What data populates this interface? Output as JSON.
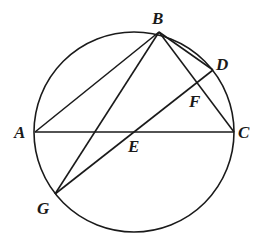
{
  "diagram": {
    "type": "circle-geometry",
    "circle": {
      "cx": 134,
      "cy": 132,
      "r": 100
    },
    "points": {
      "A": {
        "x": 35,
        "y": 132,
        "label": "A",
        "lx": 14,
        "ly": 138
      },
      "B": {
        "x": 159,
        "y": 32,
        "label": "B",
        "lx": 153,
        "ly": 24
      },
      "C": {
        "x": 234,
        "y": 132,
        "label": "C",
        "lx": 238,
        "ly": 138
      },
      "D": {
        "x": 213,
        "y": 70,
        "label": "D",
        "lx": 216,
        "ly": 70
      },
      "E": {
        "x": 133,
        "y": 132,
        "label": "E",
        "lx": 128,
        "ly": 152
      },
      "F": {
        "x": 197,
        "y": 81,
        "label": "F",
        "lx": 189,
        "ly": 107
      },
      "G": {
        "x": 55,
        "y": 194,
        "label": "G",
        "lx": 37,
        "ly": 214
      }
    },
    "segments": [
      [
        "A",
        "B"
      ],
      [
        "B",
        "G"
      ],
      [
        "B",
        "D"
      ],
      [
        "B",
        "C"
      ],
      [
        "A",
        "C"
      ],
      [
        "G",
        "D"
      ]
    ]
  }
}
